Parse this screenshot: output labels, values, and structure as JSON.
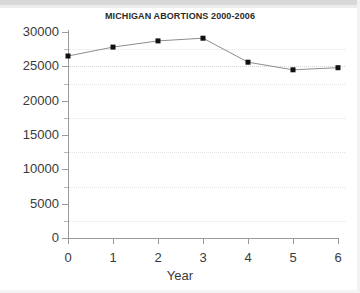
{
  "chart_data": {
    "type": "line",
    "title": "MICHIGAN ABORTIONS 2000-2006",
    "xlabel": "Year",
    "ylabel": "",
    "x": [
      0,
      1,
      2,
      3,
      4,
      5,
      6
    ],
    "values": [
      26500,
      27800,
      28700,
      29100,
      25600,
      24500,
      24800
    ],
    "series": [
      {
        "name": "Michigan abortions",
        "values": [
          26500,
          27800,
          28700,
          29100,
          25600,
          24500,
          24800
        ]
      }
    ],
    "xlim": [
      0,
      6
    ],
    "ylim": [
      0,
      30000
    ],
    "xticks": [
      "0",
      "1",
      "2",
      "3",
      "4",
      "5",
      "6"
    ],
    "yticks": [
      "0",
      "5000",
      "10000",
      "15000",
      "20000",
      "25000",
      "30000"
    ],
    "ytick_values": [
      0,
      5000,
      10000,
      15000,
      20000,
      25000,
      30000
    ],
    "gridline_values": [
      2500,
      7500,
      12500,
      17500,
      22500,
      25000,
      27500
    ],
    "grid": true,
    "legend": false,
    "marker": "square",
    "marker_color": "#111111",
    "line_color": "#8d8d8d",
    "background_color": "#ffffff",
    "axis_color": "#9a9a9a",
    "text_color": "#3a3a3a"
  }
}
